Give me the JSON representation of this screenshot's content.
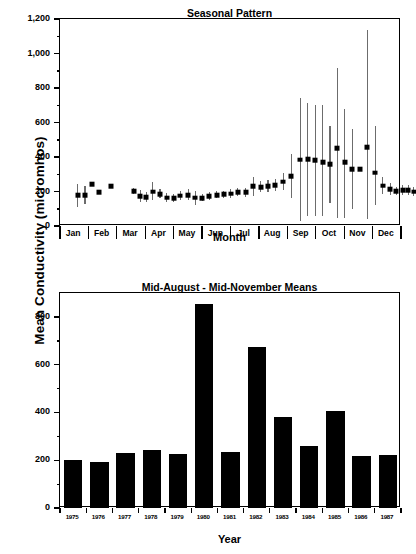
{
  "figure": {
    "ylabel": "Mean Conductivity (micromhos)"
  },
  "chart_data": [
    {
      "type": "scatter",
      "panel": "top",
      "title": "Seasonal Pattern",
      "xlabel": "Month",
      "ylabel": "Mean Conductivity (micromhos)",
      "ylim": [
        0,
        1200
      ],
      "yticks": [
        0,
        200,
        400,
        600,
        800,
        1000,
        1200
      ],
      "ytick_labels": [
        "0",
        "200",
        "400",
        "600",
        "800",
        "1,000",
        "1,200"
      ],
      "minor_tick_step": 100,
      "grid": false,
      "legend": "none",
      "categories": [
        "Jan",
        "Feb",
        "Mar",
        "Apr",
        "May",
        "Jun",
        "Jul",
        "Aug",
        "Sep",
        "Oct",
        "Nov",
        "Dec"
      ],
      "note": "Semi-monthly means with vertical range bars; February has no data",
      "points": [
        {
          "month": "Jan",
          "x": 0.12,
          "mean": 178,
          "low": 110,
          "high": 245
        },
        {
          "month": "Jan",
          "x": 0.38,
          "mean": 180,
          "low": 130,
          "high": 232
        },
        {
          "month": "Jan",
          "x": 0.62,
          "mean": 243,
          "low": 243,
          "high": 243
        },
        {
          "month": "Jan",
          "x": 0.86,
          "mean": 197,
          "low": 197,
          "high": 197
        },
        {
          "month": "Feb",
          "x": 1.3,
          "mean": 232,
          "low": 232,
          "high": 232
        },
        {
          "month": "Mar",
          "x": 2.1,
          "mean": 202,
          "low": 185,
          "high": 218
        },
        {
          "month": "Mar",
          "x": 2.32,
          "mean": 174,
          "low": 141,
          "high": 208
        },
        {
          "month": "Mar",
          "x": 2.54,
          "mean": 166,
          "low": 140,
          "high": 195
        },
        {
          "month": "Mar",
          "x": 2.76,
          "mean": 200,
          "low": 152,
          "high": 255
        },
        {
          "month": "Apr",
          "x": 3.02,
          "mean": 186,
          "low": 160,
          "high": 214
        },
        {
          "month": "Apr",
          "x": 3.26,
          "mean": 165,
          "low": 142,
          "high": 192
        },
        {
          "month": "Apr",
          "x": 3.5,
          "mean": 161,
          "low": 137,
          "high": 188
        },
        {
          "month": "Apr",
          "x": 3.74,
          "mean": 176,
          "low": 150,
          "high": 205
        },
        {
          "month": "May",
          "x": 4.02,
          "mean": 178,
          "low": 148,
          "high": 214
        },
        {
          "month": "May",
          "x": 4.26,
          "mean": 163,
          "low": 120,
          "high": 205
        },
        {
          "month": "May",
          "x": 4.5,
          "mean": 162,
          "low": 142,
          "high": 186
        },
        {
          "month": "May",
          "x": 4.76,
          "mean": 174,
          "low": 152,
          "high": 198
        },
        {
          "month": "Jun",
          "x": 5.02,
          "mean": 180,
          "low": 160,
          "high": 202
        },
        {
          "month": "Jun",
          "x": 5.26,
          "mean": 183,
          "low": 163,
          "high": 205
        },
        {
          "month": "Jun",
          "x": 5.5,
          "mean": 188,
          "low": 165,
          "high": 212
        },
        {
          "month": "Jun",
          "x": 5.76,
          "mean": 196,
          "low": 172,
          "high": 222
        },
        {
          "month": "Jul",
          "x": 6.04,
          "mean": 195,
          "low": 170,
          "high": 222
        },
        {
          "month": "Jul",
          "x": 6.3,
          "mean": 231,
          "low": 174,
          "high": 284
        },
        {
          "month": "Jul",
          "x": 6.56,
          "mean": 226,
          "low": 196,
          "high": 258
        },
        {
          "month": "Jul",
          "x": 6.82,
          "mean": 231,
          "low": 198,
          "high": 266
        },
        {
          "month": "Aug",
          "x": 7.08,
          "mean": 237,
          "low": 205,
          "high": 272
        },
        {
          "month": "Aug",
          "x": 7.36,
          "mean": 257,
          "low": 210,
          "high": 306
        },
        {
          "month": "Aug",
          "x": 7.64,
          "mean": 288,
          "low": 165,
          "high": 420
        },
        {
          "month": "Sep",
          "x": 7.96,
          "mean": 384,
          "low": 28,
          "high": 740
        },
        {
          "month": "Sep",
          "x": 8.22,
          "mean": 388,
          "low": 58,
          "high": 712
        },
        {
          "month": "Sep",
          "x": 8.48,
          "mean": 381,
          "low": 57,
          "high": 700
        },
        {
          "month": "Sep",
          "x": 8.74,
          "mean": 371,
          "low": 60,
          "high": 700
        },
        {
          "month": "Oct",
          "x": 9.0,
          "mean": 357,
          "low": 131,
          "high": 580
        },
        {
          "month": "Oct",
          "x": 9.26,
          "mean": 452,
          "low": 45,
          "high": 915
        },
        {
          "month": "Oct",
          "x": 9.52,
          "mean": 370,
          "low": 48,
          "high": 678
        },
        {
          "month": "Oct",
          "x": 9.78,
          "mean": 329,
          "low": 98,
          "high": 563
        },
        {
          "month": "Nov",
          "x": 10.04,
          "mean": 329,
          "low": 329,
          "high": 329
        },
        {
          "month": "Nov",
          "x": 10.32,
          "mean": 458,
          "low": 42,
          "high": 1136
        },
        {
          "month": "Nov",
          "x": 10.6,
          "mean": 308,
          "low": 120,
          "high": 580
        },
        {
          "month": "Nov",
          "x": 10.86,
          "mean": 233,
          "low": 186,
          "high": 282
        },
        {
          "month": "Dec",
          "x": 11.12,
          "mean": 214,
          "low": 180,
          "high": 250
        },
        {
          "month": "Dec",
          "x": 11.34,
          "mean": 202,
          "low": 177,
          "high": 228
        },
        {
          "month": "Dec",
          "x": 11.56,
          "mean": 207,
          "low": 180,
          "high": 236
        },
        {
          "month": "Dec",
          "x": 11.76,
          "mean": 209,
          "low": 182,
          "high": 240
        },
        {
          "month": "Dec",
          "x": 11.95,
          "mean": 199,
          "low": 175,
          "high": 224
        }
      ]
    },
    {
      "type": "bar",
      "panel": "bottom",
      "title": "Mid-August - Mid-November Means",
      "xlabel": "Year",
      "ylabel": "Mean Conductivity (micromhos)",
      "ylim": [
        0,
        900
      ],
      "yticks": [
        0,
        200,
        400,
        600,
        800
      ],
      "ytick_labels": [
        "0",
        "200",
        "400",
        "600",
        "800"
      ],
      "minor_tick_step": 100,
      "grid": false,
      "legend": "none",
      "categories": [
        "1975",
        "1976",
        "1977",
        "1978",
        "1979",
        "1980",
        "1981",
        "1982",
        "1983",
        "1984",
        "1985",
        "1986",
        "1987"
      ],
      "values": [
        203,
        193,
        229,
        241,
        226,
        853,
        235,
        676,
        379,
        259,
        404,
        217,
        223
      ]
    }
  ]
}
